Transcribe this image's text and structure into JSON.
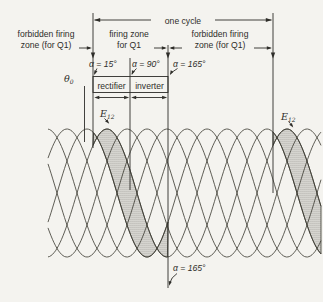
{
  "colors": {
    "paper": "#f4f3ef",
    "ink": "#2e2d29",
    "curve": "#38372f",
    "stipple_dot": "#4c4b43"
  },
  "labels": {
    "one_cycle": "one cycle",
    "forbidden_left_line1": "forbidden firing",
    "forbidden_left_line2": "zone (for Q1)",
    "firing_zone_line1": "firing zone",
    "firing_zone_line2": "for Q1",
    "forbidden_right_line1": "forbidden firing",
    "forbidden_right_line2": "zone (for Q1)",
    "alpha_15": "α = 15°",
    "alpha_90": "α = 90°",
    "alpha_165": "α = 165°",
    "alpha_165_bottom": "α = 165°",
    "rectifier": "rectifier",
    "inverter": "inverter",
    "theta_base": "θ",
    "theta_sub": "0",
    "e12_base": "E",
    "e12_sub": "12"
  },
  "waveform": {
    "type": "sine-braid",
    "description": "Overlapping phase-shifted sinusoidal voltage waveforms with stippled E12 firing-zone band from alpha=15 deg to alpha=165 deg, repeated one cycle later",
    "num_phases": 6,
    "period_px": 120,
    "peak_spacing_px": 20,
    "center_y": 193,
    "amplitude_px": 64,
    "x_range": [
      48,
      321
    ],
    "curve_peak_offsets": [
      47,
      67,
      87,
      107,
      127,
      147
    ],
    "e12_peak_x": [
      107,
      287
    ],
    "one_cycle_span_px": [
      93,
      273
    ],
    "key_angles_deg": [
      15,
      90,
      165
    ],
    "shaded_bands": [
      {
        "upper_peak_x": 107,
        "lower_peak_x": 87,
        "x_from": 93,
        "x_to": 168
      },
      {
        "upper_peak_x": 287,
        "lower_peak_x": 267,
        "x_from": 273,
        "x_to": 321
      }
    ]
  }
}
